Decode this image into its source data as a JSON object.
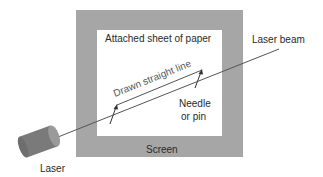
{
  "diagram": {
    "labels": {
      "paper": "Attached sheet of paper",
      "beam": "Laser beam",
      "drawn_line": "Drawn straight line",
      "needle_line1": "Needle",
      "needle_line2": "or pin",
      "screen": "Screen",
      "laser": "Laser"
    },
    "colors": {
      "screen": "#a6a6a6",
      "paper": "#ffffff",
      "beam": "#555555",
      "laser_body": "#7a7a7a",
      "laser_face": "#9a9a9a"
    }
  }
}
